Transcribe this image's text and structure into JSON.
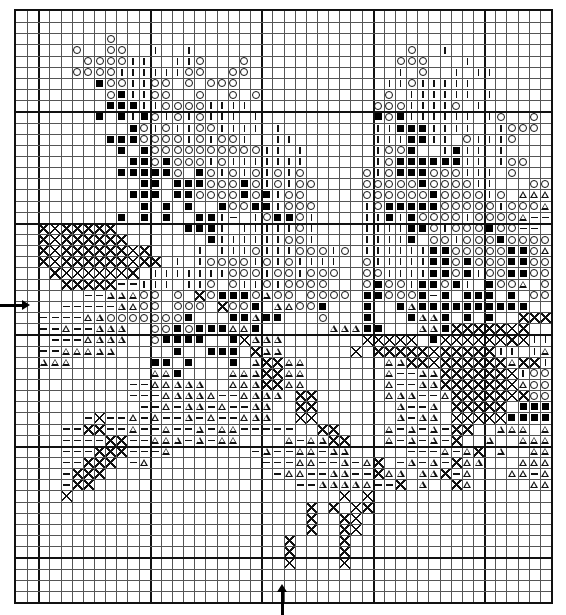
{
  "chart": {
    "columns": 48,
    "rows": 53,
    "major_grid_every": 10,
    "major_grid_col_offset": 2,
    "major_grid_row_offset": 9,
    "legend_symbols": {
      ".": "empty",
      "o": "circle",
      "|": "vertical-bar",
      "#": "filled-square",
      "t": "triangle",
      "-": "dash",
      "x": "cross-hatch"
    },
    "center_markers": {
      "left_arrow_row": 26,
      "bottom_arrow_col": 24
    },
    "grid": [
      "................................................",
      "................................................",
      "........o.......................................",
      ".....o..oo..|..|...................o..|.........",
      "......oooo||..||o...o.............ooo...|.......",
      ".....oooo||||||oo..oo.............|.o..|.||.....",
      ".......#oo||oo.o.ooo.............||o|||||.......",
      "........o#||oo..o..o.o...........o.||||||.|.....",
      "........###||oooo||||...........ooo||||o.|......",
      ".......#.#|#o|o|o|||.|..........#o#||||||.|o..o.",
      "..........#o|o||oo||||.|........||###||||..|ooo.",
      "........###oooo|o|oo|..||.......|||##||.o|||o...",
      ".........#.#oooooooooo||.|......|oo#..|#||.|....",
      "..........##o#ooo|o|||||||......|o######||.|oo..",
      ".........#####o.#o|o|o|o|o.....o|o###ooo|||.o...tttttt",
      "...........##.###ooo#o|o|oo....ooooo#oooo||...oo.ttttxxx--",
      "..........###.##oooo#o#|oo.....oooooo#oooo|o.tttxxx----",
      "...........#.#.#..#oo##|ooo....|o#####ooooo|ooottt-t--t-tt",
      ".........#.#.#..##|-.|o##o|....||#|#oooo|oooot----....tt.",
      "..xxxxxxx......###|.|||||o|....||||##o|ooo#oo--..--..tt..",
      "..xxxxxxxx.......#||||||oo|....||||#.oo|ooo#oooootttt....",
      "..xxxxxxxxxx....|.|||o|||ooo|o.||||||##ooooo##otttt......",
      "..xxxxxxxxxxx.|.|oooo|o|o||||..o|||||##o#ooo##oooo.......",
      "...xxxxxxxx.|||||||ooo|oo|ooo..oo||||##o#|oo##oo..tt.....",
      "....xxxxx--|||.||o.o||o|oooo...o#oo|##o#|.#oot.ot.tt.....",
      "......--tttoo.o.xo###otoo.oooo.##ooo#-#.###.#.ooo..tt....",
      "....-----ttoo.ooo.xoo#.ttoo#...#..#t##########..o..t.tt..",
      "..----ttooooooo#...##t##...o...#...#tt#.#.#..xxxxx.tttttt",
      "..--t--ttt..oo#o###tt#......ttt##...tt#xxxxxxx.....tttoo#t",
      "...---tttt..o####..#xttt.......xxxxx.#xxxxxxxx|||..tto.o#",
      "..--ttttt.....#..###.xtt......x.xxxxxxxxxxx||.|tooo.oo",
      "..ttt.......##.#...#.txxtt.......ttxxxxxxxxxtxx||||o|oo",
      "............tt#....tttxxtt.......t--ttxxxxxxx|oooxx||o|oo#",
      "..........--ttttt..tttxxtt.......t--ttxxxxxxxtoooo|xo|#|##",
      "..........---ttttt--tttt.xx......ttt--txxxxxxxoo#o|||oo##",
      "...........--t-tt-t--tt..xx.......t--t.xxxxx.#####o##o#xx",
      "......-x--t-t--t-t--ttt..xx.......t-tt.xxxxx######o###.xx#",
      "....--xx--t--t--t-tt-----..xx....t-t-t-xx..ttt.t####t##xxxx",
      "....----xx--ttt-t-tt....t-ttxx...t-t-t-x..t..ttt##t##--xxx",
      "....---xxx---t.......-t--tt-tt.....---t-tx.t..ttttt----xxx",
      "....--xxx.-t..........---tt--t-tx.-t-t-xtt...ttt----tt-xxx",
      "....-xxx...............-tt--tt--xtt.ttx-t...tt-tt-t-txxx",
      "....-xx..................--ttttt--x.t..xt.....tttttt---xx",
      "....x........................x.x..........................",
      "..........................x.x.xx..........................",
      "..........................x..xx...........................",
      "..........................x..xx...........................",
      "........................x....x............................",
      "........................x....x............................",
      "........................x....x............................",
      "..........................................................",
      "..........................................................",
      ".........................................................."
    ]
  }
}
